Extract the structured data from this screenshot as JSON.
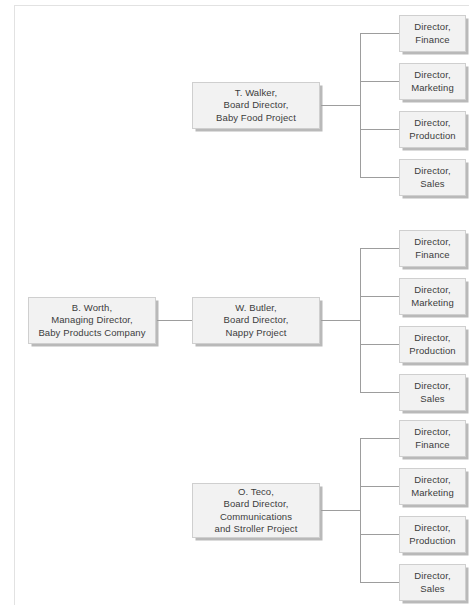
{
  "diagram": {
    "type": "organizational-chart",
    "colors": {
      "node_fill": "#f2f2f2",
      "node_border": "#cfcfcf",
      "node_shadow": "#b9b9b9",
      "text": "#3c3c3c",
      "connector": "#9d9d9d",
      "page_rule": "#e2e2e2",
      "background": "#ffffff"
    },
    "root": {
      "label": "B. Worth,\nManaging Director,\nBaby Products Company",
      "name": "B. Worth",
      "role": "Managing Director",
      "unit": "Baby Products Company"
    },
    "branches": [
      {
        "id": "baby-food",
        "label": "T. Walker,\nBoard Director,\nBaby Food Project",
        "name": "T. Walker",
        "role": "Board Director",
        "unit": "Baby Food Project",
        "children": [
          {
            "label": "Director,\nFinance",
            "role": "Director",
            "unit": "Finance"
          },
          {
            "label": "Director,\nMarketing",
            "role": "Director",
            "unit": "Marketing"
          },
          {
            "label": "Director,\nProduction",
            "role": "Director",
            "unit": "Production"
          },
          {
            "label": "Director,\nSales",
            "role": "Director",
            "unit": "Sales"
          }
        ]
      },
      {
        "id": "nappy",
        "label": "W. Butler,\nBoard Director,\nNappy Project",
        "name": "W. Butler",
        "role": "Board Director",
        "unit": "Nappy Project",
        "children": [
          {
            "label": "Director,\nFinance",
            "role": "Director",
            "unit": "Finance"
          },
          {
            "label": "Director,\nMarketing",
            "role": "Director",
            "unit": "Marketing"
          },
          {
            "label": "Director,\nProduction",
            "role": "Director",
            "unit": "Production"
          },
          {
            "label": "Director,\nSales",
            "role": "Director",
            "unit": "Sales"
          }
        ]
      },
      {
        "id": "communications-stroller",
        "label": "O. Teco,\nBoard Director,\nCommunications\nand Stroller Project",
        "name": "O. Teco",
        "role": "Board Director",
        "unit": "Communications and Stroller Project",
        "children": [
          {
            "label": "Director,\nFinance",
            "role": "Director",
            "unit": "Finance"
          },
          {
            "label": "Director,\nMarketing",
            "role": "Director",
            "unit": "Marketing"
          },
          {
            "label": "Director,\nProduction",
            "role": "Director",
            "unit": "Production"
          },
          {
            "label": "Director,\nSales",
            "role": "Director",
            "unit": "Sales"
          }
        ]
      }
    ]
  }
}
